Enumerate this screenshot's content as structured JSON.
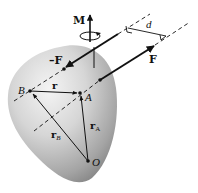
{
  "diagram": {
    "colors": {
      "body_light": "#f2f2f2",
      "body_dark": "#8f8f8f",
      "ink": "#111111",
      "background": "#ffffff"
    },
    "labels": {
      "moment": "M",
      "force_neg": "–F",
      "force_pos": "F",
      "distance": "d",
      "position_r": "r",
      "point_a": "A",
      "point_b": "B",
      "point_o": "O",
      "rb_main": "r",
      "rb_sub": "B",
      "ra_main": "r",
      "ra_sub": "A"
    },
    "elements": [
      {
        "id": "rigid-body",
        "kind": "shaded blob"
      },
      {
        "id": "moment-vector",
        "kind": "vertical arrow with rotation ellipse"
      },
      {
        "id": "force-neg",
        "kind": "arrow along upper line of action"
      },
      {
        "id": "force-pos",
        "kind": "arrow along lower line of action"
      },
      {
        "id": "distance-d",
        "kind": "perpendicular dimension between lines of action"
      },
      {
        "id": "vector-r",
        "kind": "arrow B to A"
      },
      {
        "id": "vector-rA",
        "kind": "arrow O to A"
      },
      {
        "id": "vector-rB",
        "kind": "arrow O to B"
      }
    ]
  }
}
